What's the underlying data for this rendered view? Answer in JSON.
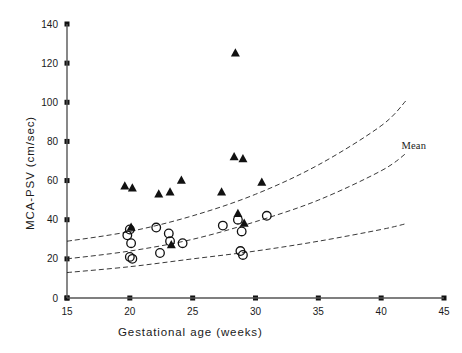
{
  "chart_data": {
    "type": "scatter",
    "title": "",
    "xlabel": "Gestational age (weeks)",
    "ylabel": "MCA-PSV (cm/sec)",
    "xlim": [
      15,
      45
    ],
    "ylim": [
      0,
      140
    ],
    "xticks": [
      15,
      20,
      25,
      30,
      35,
      40,
      45
    ],
    "yticks": [
      0,
      20,
      40,
      60,
      80,
      100,
      120,
      140
    ],
    "grid": false,
    "legend_position": "none",
    "annotations": [
      {
        "text": "Mean",
        "x": 42.6,
        "y": 76
      }
    ],
    "series": [
      {
        "name": "filled-triangles",
        "marker": "triangle",
        "fill": "#111111",
        "points": [
          {
            "x": 19.6,
            "y": 57
          },
          {
            "x": 20.2,
            "y": 56
          },
          {
            "x": 22.3,
            "y": 53
          },
          {
            "x": 23.2,
            "y": 54
          },
          {
            "x": 20.1,
            "y": 36
          },
          {
            "x": 23.3,
            "y": 27
          },
          {
            "x": 24.1,
            "y": 60
          },
          {
            "x": 27.3,
            "y": 54
          },
          {
            "x": 28.4,
            "y": 125
          },
          {
            "x": 28.3,
            "y": 72
          },
          {
            "x": 29.0,
            "y": 71
          },
          {
            "x": 28.6,
            "y": 43
          },
          {
            "x": 29.1,
            "y": 38
          },
          {
            "x": 30.5,
            "y": 59
          }
        ]
      },
      {
        "name": "open-circles",
        "marker": "circle",
        "fill": "none",
        "points": [
          {
            "x": 19.8,
            "y": 32
          },
          {
            "x": 20.0,
            "y": 35
          },
          {
            "x": 20.1,
            "y": 28
          },
          {
            "x": 20.0,
            "y": 21
          },
          {
            "x": 20.2,
            "y": 20
          },
          {
            "x": 22.1,
            "y": 36
          },
          {
            "x": 22.4,
            "y": 23
          },
          {
            "x": 23.1,
            "y": 33
          },
          {
            "x": 23.2,
            "y": 29
          },
          {
            "x": 24.2,
            "y": 28
          },
          {
            "x": 27.4,
            "y": 37
          },
          {
            "x": 28.6,
            "y": 40
          },
          {
            "x": 28.9,
            "y": 34
          },
          {
            "x": 28.8,
            "y": 24
          },
          {
            "x": 29.0,
            "y": 22
          },
          {
            "x": 30.9,
            "y": 42
          }
        ]
      }
    ],
    "reference_curves": [
      {
        "name": "upper-curve",
        "style": "dashed",
        "x": [
          15,
          20,
          25,
          30,
          35,
          40,
          42
        ],
        "y": [
          29,
          34,
          42,
          53,
          68,
          88,
          101
        ]
      },
      {
        "name": "mean-curve",
        "style": "dashed",
        "x": [
          15,
          20,
          25,
          30,
          35,
          40,
          42
        ],
        "y": [
          20,
          24,
          30,
          39,
          50,
          65,
          74
        ]
      },
      {
        "name": "lower-curve",
        "style": "dashed",
        "x": [
          15,
          20,
          25,
          30,
          35,
          40,
          42
        ],
        "y": [
          13,
          16,
          20,
          24,
          29,
          35,
          38
        ]
      }
    ]
  }
}
